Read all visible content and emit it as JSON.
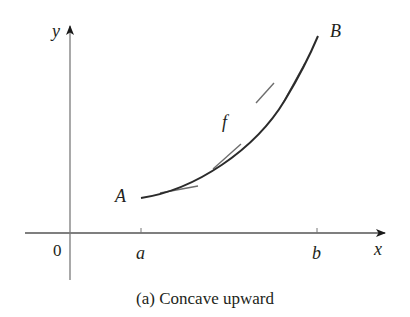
{
  "figure": {
    "caption": "(a) Concave upward",
    "axes": {
      "x_label": "x",
      "y_label": "y",
      "origin_label": "0",
      "ticks": [
        {
          "label": "a"
        },
        {
          "label": "b"
        }
      ]
    },
    "curve": {
      "function_label": "f",
      "start_point_label": "A",
      "end_point_label": "B",
      "description": "Concave upward curve from A to B with tangent lines lying below the curve"
    },
    "colors": {
      "curve": "#2b2b2b",
      "tangent": "#6d6d6d",
      "axis": "#7a7a7a",
      "text": "#231f20"
    }
  }
}
